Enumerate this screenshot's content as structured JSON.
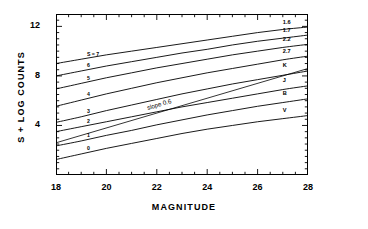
{
  "chart_data": {
    "type": "line",
    "title": "",
    "xlabel": "MAGNITUDE",
    "ylabel": "S + LOG COUNTS",
    "xlim": [
      18,
      28
    ],
    "ylim": [
      0,
      13
    ],
    "xticks": [
      "18",
      "20",
      "22",
      "24",
      "26",
      "28"
    ],
    "yticks": [
      "4",
      "8",
      "12"
    ],
    "grid": false,
    "legend": "inline-curve-labels",
    "annotations": [
      {
        "text": "slope 0.6",
        "x": 21.6,
        "y": 5.2
      }
    ],
    "x": [
      18,
      19,
      20,
      21,
      22,
      23,
      24,
      25,
      26,
      27,
      28
    ],
    "series": [
      {
        "name": "S = 7",
        "left_label": "S = 7",
        "right_label": "1.6",
        "values": [
          9.0,
          9.35,
          9.7,
          10.0,
          10.3,
          10.6,
          10.9,
          11.2,
          11.5,
          11.75,
          11.95
        ]
      },
      {
        "name": "6",
        "left_label": "6",
        "right_label": "1.7",
        "values": [
          8.0,
          8.4,
          8.8,
          9.15,
          9.5,
          9.85,
          10.15,
          10.5,
          10.8,
          11.05,
          11.3
        ]
      },
      {
        "name": "5",
        "left_label": "5",
        "right_label": "2.2",
        "values": [
          6.95,
          7.4,
          7.85,
          8.25,
          8.65,
          9.0,
          9.35,
          9.7,
          10.0,
          10.3,
          10.55
        ]
      },
      {
        "name": "4",
        "left_label": "4",
        "right_label": "2.7",
        "values": [
          5.55,
          6.05,
          6.55,
          7.0,
          7.45,
          7.85,
          8.25,
          8.6,
          8.95,
          9.3,
          9.6
        ]
      },
      {
        "name": "3",
        "left_label": "3",
        "right_label": "K",
        "values": [
          4.25,
          4.7,
          5.2,
          5.65,
          6.1,
          6.55,
          6.95,
          7.35,
          7.7,
          8.05,
          8.4
        ]
      },
      {
        "name": "2",
        "left_label": "2",
        "right_label": "J",
        "values": [
          3.5,
          3.9,
          4.3,
          4.7,
          5.1,
          5.5,
          5.85,
          6.2,
          6.55,
          6.9,
          7.2
        ]
      },
      {
        "name": "1",
        "left_label": "1",
        "right_label": "B",
        "values": [
          2.35,
          2.75,
          3.2,
          3.6,
          4.05,
          4.45,
          4.85,
          5.2,
          5.55,
          5.85,
          6.15
        ]
      },
      {
        "name": "0",
        "left_label": "0",
        "right_label": "V",
        "values": [
          1.25,
          1.7,
          2.15,
          2.55,
          2.95,
          3.35,
          3.7,
          4.0,
          4.3,
          4.55,
          4.8
        ]
      }
    ],
    "reference_line": {
      "label": "slope 0.6",
      "slope": 0.6,
      "x0": 18.0,
      "y0": 2.6,
      "x1": 28.0,
      "y1": 8.6
    }
  }
}
